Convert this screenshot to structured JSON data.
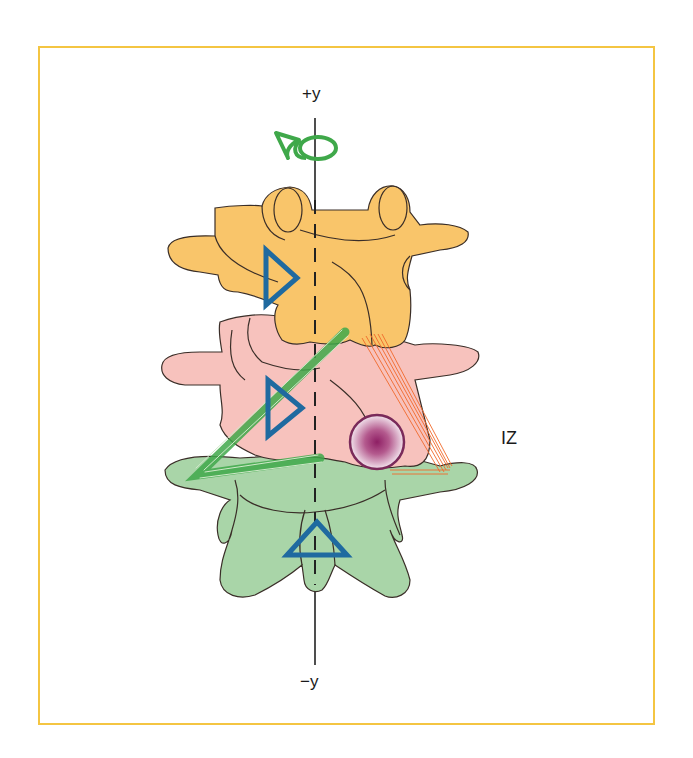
{
  "figure": {
    "axis_labels": {
      "positive_y": "+y",
      "negative_y": "−y"
    },
    "region_label": "IZ",
    "colors": {
      "frame_border": "#f4c542",
      "upper_vertebra_fill": "#f9c56a",
      "middle_vertebra_fill": "#f7c2bd",
      "lower_vertebra_fill": "#a9d5a8",
      "outline": "#3a2e28",
      "triangle_marker": "#1f6aa0",
      "green_ligament": "#3fa84a",
      "orange_ligament": "#f0692a",
      "lesion_circle_fill": "#8e1f64",
      "lesion_circle_border": "#7a2a5a",
      "axis_line": "#222222"
    },
    "elements": [
      {
        "name": "upper-vertebra",
        "color": "orange"
      },
      {
        "name": "middle-vertebra",
        "color": "pink"
      },
      {
        "name": "lower-vertebra",
        "color": "green"
      },
      {
        "name": "triangle-marker-upper",
        "orientation": "right"
      },
      {
        "name": "triangle-marker-middle",
        "orientation": "right"
      },
      {
        "name": "triangle-marker-lower",
        "orientation": "up"
      },
      {
        "name": "rotation-symbol",
        "color": "green"
      },
      {
        "name": "lesion-circle",
        "color": "purple"
      },
      {
        "name": "green-ligament-band"
      },
      {
        "name": "orange-ligament-band"
      }
    ]
  }
}
